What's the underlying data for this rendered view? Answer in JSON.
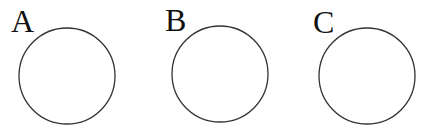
{
  "diagram": {
    "type": "labeled-circles",
    "stroke_color": "#333333",
    "background": "#ffffff",
    "items": [
      {
        "label": "A",
        "label_x": 11,
        "label_y": 32,
        "cx": 67,
        "cy": 76,
        "r": 48
      },
      {
        "label": "B",
        "label_x": 165,
        "label_y": 31,
        "cx": 220,
        "cy": 74,
        "r": 48
      },
      {
        "label": "C",
        "label_x": 313,
        "label_y": 33,
        "cx": 367,
        "cy": 76,
        "r": 48
      }
    ]
  }
}
